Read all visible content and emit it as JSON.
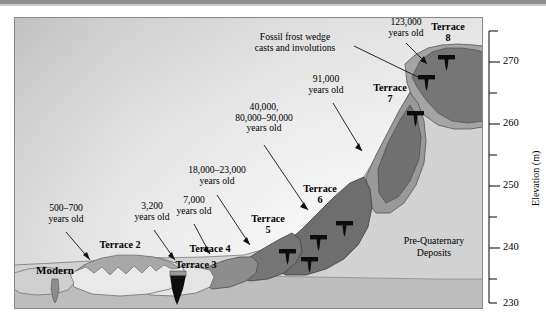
{
  "figure": {
    "type": "geologic-cross-section",
    "axis": {
      "label": "Elevation (m)",
      "unit": "m",
      "ticks_major": [
        230,
        240,
        250,
        260,
        270
      ],
      "ticks_minor": [
        235,
        245,
        255,
        265,
        275,
        225
      ],
      "range": [
        224,
        276
      ]
    },
    "annotations": [
      {
        "id": "a1",
        "text": "500–700\nyears old",
        "lines": [
          "500–700",
          "years old"
        ]
      },
      {
        "id": "a2",
        "text": "3,200\nyears old",
        "lines": [
          "3,200",
          "years old"
        ]
      },
      {
        "id": "a3",
        "text": "7,000\nyears old",
        "lines": [
          "7,000",
          "years old"
        ]
      },
      {
        "id": "a4",
        "text": "18,000–23,000\nyears old",
        "lines": [
          "18,000–23,000",
          "years old"
        ]
      },
      {
        "id": "a5",
        "text": "40,000,\n80,000–90,000\nyears old",
        "lines": [
          "40,000,",
          "80,000–90,000",
          "years old"
        ]
      },
      {
        "id": "a6",
        "text": "91,000\nyears old",
        "lines": [
          "91,000",
          "years old"
        ]
      },
      {
        "id": "a7",
        "text": "123,000\nyears old",
        "lines": [
          "123,000",
          "years old"
        ]
      },
      {
        "id": "a8",
        "text": "Fossil frost wedge\ncasts and involutions",
        "lines": [
          "Fossil frost wedge",
          "casts and involutions"
        ]
      }
    ],
    "units": [
      {
        "id": "modern",
        "label": "Modern"
      },
      {
        "id": "t2",
        "label": "Terrace 2"
      },
      {
        "id": "t3",
        "label": "Terrace 3"
      },
      {
        "id": "t4",
        "label": "Terrace 4"
      },
      {
        "id": "t5",
        "label": "Terrace",
        "number": "5"
      },
      {
        "id": "t6",
        "label": "Terrace",
        "number": "6"
      },
      {
        "id": "t7",
        "label": "Terrace",
        "number": "7"
      },
      {
        "id": "t8",
        "label": "Terrace",
        "number": "8"
      },
      {
        "id": "preq",
        "label": "Pre-Quaternary",
        "label2": "Deposits"
      }
    ],
    "colors": {
      "sky_top": "#c8c8c8",
      "sky_bottom": "#fdfdfd",
      "prequaternary": "#d2d2d2",
      "terrace_dark": "#6e6e6e",
      "terrace_mid": "#a9a9a9",
      "terrace_light": "#e6e6e6",
      "basement": "#b9b9b9",
      "wedge_black": "#0d0d0d",
      "outline": "#4a4a4a"
    },
    "symbols": {
      "frost_wedge": "T-shaped black frost wedge cast symbol",
      "frost_wedge_count": 7
    }
  },
  "axis_tick_labels": {
    "t230": "230",
    "t240": "240",
    "t250": "250",
    "t260": "260",
    "t270": "270",
    "elevation_label": "Elevation (m)"
  },
  "labels": {
    "modern": "Modern",
    "terrace2": "Terrace 2",
    "terrace3": "Terrace 3",
    "terrace4": "Terrace 4",
    "terrace5_word": "Terrace",
    "terrace5_num": "5",
    "terrace6_word": "Terrace",
    "terrace6_num": "6",
    "terrace7_word": "Terrace",
    "terrace7_num": "7",
    "terrace8_word": "Terrace",
    "terrace8_num": "8",
    "prequaternary1": "Pre-Quaternary",
    "prequaternary2": "Deposits",
    "ann1a": "500–700",
    "ann1b": "years old",
    "ann2a": "3,200",
    "ann2b": "years old",
    "ann3a": "7,000",
    "ann3b": "years old",
    "ann4a": "18,000–23,000",
    "ann4b": "years old",
    "ann5a": "40,000,",
    "ann5b": "80,000–90,000",
    "ann5c": "years old",
    "ann6a": "91,000",
    "ann6b": "years old",
    "ann7a": "123,000",
    "ann7b": "years old",
    "ann8a": "Fossil frost wedge",
    "ann8b": "casts and involutions"
  }
}
